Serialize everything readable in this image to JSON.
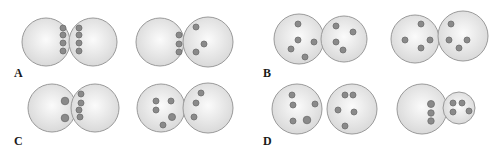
{
  "figure": {
    "colors": {
      "cell_fill_center": "#fbfbfb",
      "cell_fill_edge": "#d9d9d9",
      "cell_border": "#9a9a9a",
      "dot_fill": "#8a8a8a",
      "dot_border": "#6e6e6e",
      "label": "#1a1a1a"
    },
    "panels": [
      {
        "label": "A",
        "pairs": [
          {
            "left_cell_dots": 4,
            "right_cell_dots": 4,
            "arrangement": "dots aligned in columns at contact boundary"
          },
          {
            "left_cell_dots": 3,
            "right_cell_dots": 3,
            "arrangement": "left dots aligned at boundary, right dots scattered"
          }
        ]
      },
      {
        "label": "B",
        "pairs": [
          {
            "left_cell_dots": 5,
            "right_cell_dots": 4,
            "arrangement": "dots scattered"
          },
          {
            "left_cell_dots": 4,
            "right_cell_dots": 4,
            "arrangement": "dots scattered"
          }
        ]
      },
      {
        "label": "C",
        "pairs": [
          {
            "left_cell_dots": 2,
            "right_cell_dots": 4,
            "arrangement": "dots clustered at contact boundary"
          },
          {
            "left_cell_dots": 5,
            "right_cell_dots": 3,
            "arrangement": "dots scattered"
          }
        ]
      },
      {
        "label": "D",
        "pairs": [
          {
            "left_cell_dots": 5,
            "right_cell_dots": 5,
            "arrangement": "separated cells, dots scattered"
          },
          {
            "left_cell_dots": 3,
            "right_cell_dots": 4,
            "arrangement": "large cell with aligned dots, small cell with scattered dots"
          }
        ]
      }
    ]
  }
}
